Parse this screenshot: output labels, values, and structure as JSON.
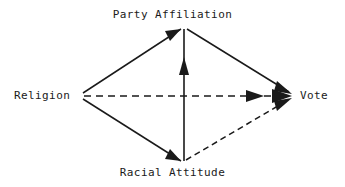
{
  "diagram": {
    "type": "path-diagram",
    "background_color": "#ffffff",
    "line_color": "#1a1a1a",
    "nodes": [
      {
        "id": "party",
        "label": "Party Affiliation",
        "position": "top",
        "x": 184,
        "y": 27
      },
      {
        "id": "religion",
        "label": "Religion",
        "position": "left",
        "x": 80,
        "y": 95
      },
      {
        "id": "vote",
        "label": "Vote",
        "position": "right",
        "x": 292,
        "y": 95
      },
      {
        "id": "racial",
        "label": "Racial Attitude",
        "position": "bottom",
        "x": 184,
        "y": 163
      }
    ],
    "edges": [
      {
        "id": "religion-to-party",
        "from": "Religion",
        "to": "Party Affiliation",
        "style": "solid",
        "arrow": "single"
      },
      {
        "id": "religion-to-racial",
        "from": "Religion",
        "to": "Racial Attitude",
        "style": "solid",
        "arrow": "single"
      },
      {
        "id": "party-to-vote",
        "from": "Party Affiliation",
        "to": "Vote",
        "style": "solid",
        "arrow": "single"
      },
      {
        "id": "racial-to-party",
        "from": "Racial Attitude",
        "to": "Party Affiliation",
        "style": "solid",
        "arrow": "single"
      },
      {
        "id": "religion-to-vote",
        "from": "Religion",
        "to": "Vote",
        "style": "dashed",
        "arrow": "double"
      },
      {
        "id": "racial-to-vote",
        "from": "Racial Attitude",
        "to": "Vote",
        "style": "dashed",
        "arrow": "single"
      }
    ]
  }
}
